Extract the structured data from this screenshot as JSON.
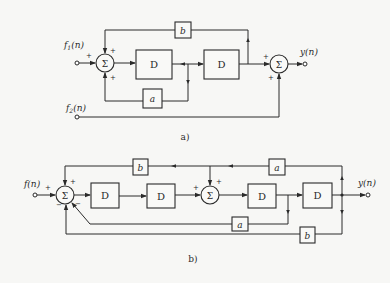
{
  "diagram_a": {
    "caption": "a)",
    "inputs": [
      "f1(n)",
      "f2(n)"
    ],
    "input_labels": {
      "f1": "f",
      "f1_sub": "1",
      "f2": "f",
      "f2_sub": "2",
      "arg": "(n)"
    },
    "output": "y(n)",
    "delays": [
      "D",
      "D"
    ],
    "gains": {
      "top": "b",
      "bottom": "a"
    },
    "summer_symbol": "Σ",
    "signs": {
      "sum1_input": "+",
      "sum1_top": "+",
      "sum1_bottom": "+",
      "sum2_left": "+",
      "sum2_bottom": "+"
    }
  },
  "diagram_b": {
    "caption": "b)",
    "input": "f(n)",
    "output": "y(n)",
    "delays": [
      "D",
      "D",
      "D",
      "D"
    ],
    "gains": {
      "top_left": "b",
      "top_right": "a",
      "mid": "a",
      "bottom": "b"
    },
    "summer_symbol": "Σ",
    "signs": {
      "sum1_input": "+",
      "sum1_top": "+",
      "sum1_lower_right": "−",
      "sum1_bottom": "−",
      "sum2_left": "+",
      "sum2_top": "+"
    }
  }
}
